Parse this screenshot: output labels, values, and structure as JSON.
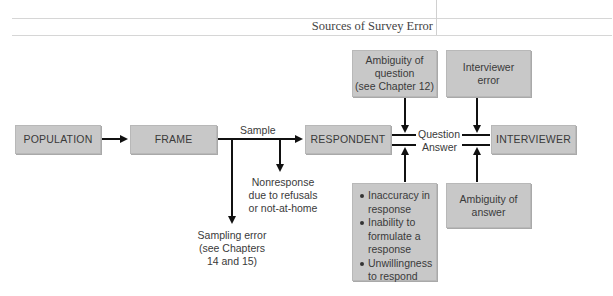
{
  "header": {
    "title": "Sources of Survey Error"
  },
  "diagram": {
    "nodes": {
      "population": "POPULATION",
      "frame": "FRAME",
      "respondent": "RESPONDENT",
      "interviewer": "INTERVIEWER",
      "ambiguity_question": [
        "Ambiguity of",
        "question",
        "(see Chapter 12)"
      ],
      "interviewer_error": [
        "Interviewer",
        "error"
      ],
      "ambiguity_answer": [
        "Ambiguity of",
        "answer"
      ],
      "respondent_errors": [
        [
          "Inaccuracy in",
          "response"
        ],
        [
          "Inability to",
          "formulate a",
          "response"
        ],
        [
          "Unwillingness",
          "to respond"
        ]
      ]
    },
    "labels": {
      "sample": "Sample",
      "question": "Question",
      "answer": "Answer",
      "nonresponse": [
        "Nonresponse",
        "due to refusals",
        "or not-at-home"
      ],
      "sampling_error": [
        "Sampling error",
        "(see Chapters",
        "14 and 15)"
      ]
    },
    "colors": {
      "box_fill": "#c8c8c8",
      "arrow": "#111111",
      "text": "#3a3a3a"
    }
  }
}
